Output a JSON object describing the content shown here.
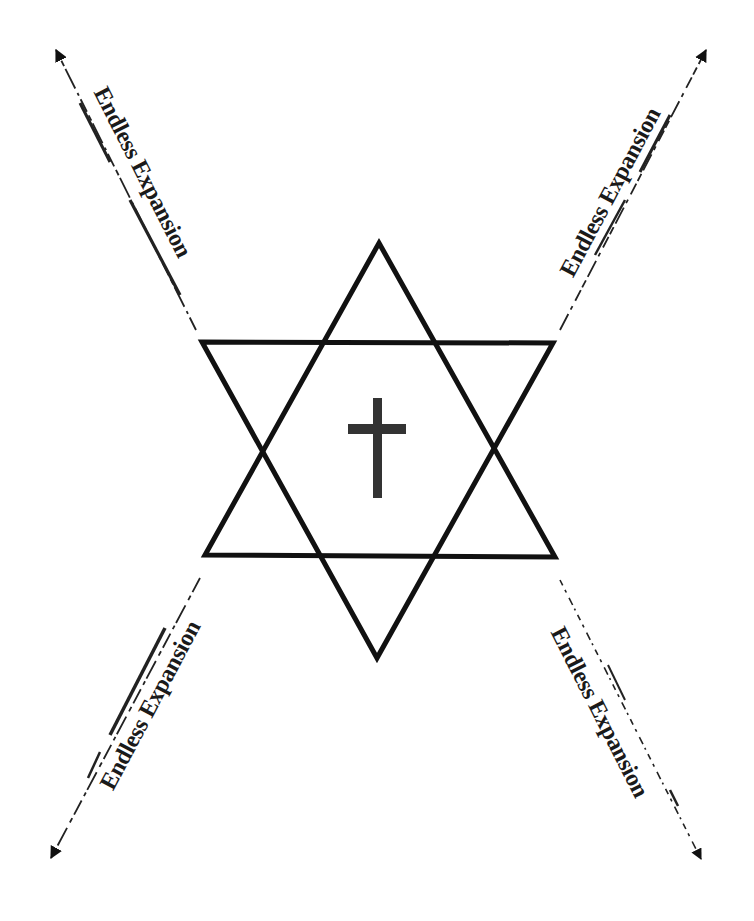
{
  "diagram": {
    "center_symbol": "cross-icon",
    "central_figure": "hexagram",
    "labels": {
      "top_left": "Endless Expansion",
      "top_right": "Endless Expansion",
      "bottom_left": "Endless Expansion",
      "bottom_right": "Endless Expansion"
    },
    "colors": {
      "background": "#ffffff",
      "stroke": "#111111",
      "cross": "#333333",
      "text": "#1a1a1a"
    }
  }
}
